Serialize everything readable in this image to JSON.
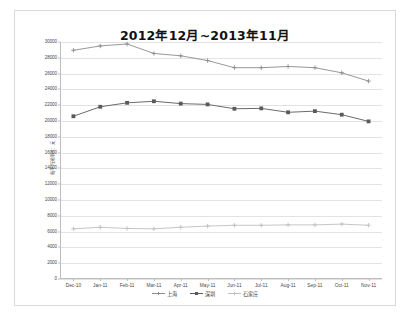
{
  "chart_data": {
    "type": "line",
    "title": "2012年12月~2013年11月",
    "xlabel": "",
    "ylabel": "每平方米单价：元",
    "grid": true,
    "legend_position": "bottom",
    "ylim": [
      0,
      30000
    ],
    "ytick_step": 2000,
    "ytick_labels": [
      "30000",
      "28000",
      "26000",
      "24000",
      "22000",
      "20000",
      "18000",
      "16000",
      "14000",
      "12000",
      "10000",
      "8000",
      "6000",
      "4000",
      "2000",
      "0"
    ],
    "categories": [
      "Dec-10",
      "Jan-11",
      "Feb-11",
      "Mar-11",
      "Apr-11",
      "May-11",
      "Jun-11",
      "Jul-11",
      "Aug-11",
      "Sep-11",
      "Oct-11",
      "Nov-11"
    ],
    "series": [
      {
        "name": "上海",
        "color": "#8c8c8c",
        "marker": "plus",
        "values": [
          28950,
          29500,
          29750,
          28550,
          28250,
          27650,
          26750,
          26750,
          26900,
          26750,
          26100,
          25050
        ]
      },
      {
        "name": "深圳",
        "color": "#5a5a5a",
        "marker": "square",
        "values": [
          20600,
          21800,
          22300,
          22500,
          22200,
          22100,
          21550,
          21600,
          21100,
          21250,
          20800,
          19950
        ]
      },
      {
        "name": "石家庄",
        "color": "#bfbfbf",
        "marker": "plus",
        "values": [
          6350,
          6550,
          6400,
          6350,
          6550,
          6700,
          6800,
          6800,
          6850,
          6850,
          6950,
          6800
        ]
      }
    ]
  },
  "legend": {
    "items": [
      {
        "label": "上海"
      },
      {
        "label": "深圳"
      },
      {
        "label": "石家庄"
      }
    ]
  }
}
